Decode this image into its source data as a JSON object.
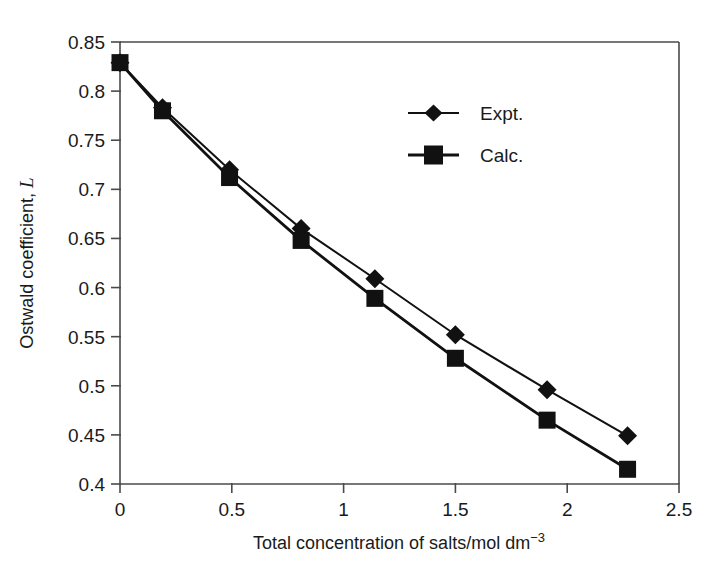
{
  "chart_data": {
    "type": "line",
    "title": "",
    "xlabel": "Total concentration of salts/mol dm⁻³",
    "xlabel_main": "Total concentration of salts/mol dm",
    "xlabel_exponent": "−3",
    "ylabel": "Ostwald coefficient, L",
    "ylabel_main": "Ostwald coefficient,",
    "ylabel_symbol": "L",
    "xlim": [
      0,
      2.5
    ],
    "ylim": [
      0.4,
      0.85
    ],
    "xticks": [
      0,
      0.5,
      1,
      1.5,
      2,
      2.5
    ],
    "xtick_labels": [
      "0",
      "0.5",
      "1",
      "1.5",
      "2",
      "2.5"
    ],
    "yticks": [
      0.4,
      0.45,
      0.5,
      0.55,
      0.6,
      0.65,
      0.7,
      0.75,
      0.8,
      0.85
    ],
    "ytick_labels": [
      "0.4",
      "0.45",
      "0.5",
      "0.55",
      "0.6",
      "0.65",
      "0.7",
      "0.75",
      "0.8",
      "0.85"
    ],
    "grid": false,
    "legend_position": "upper-right-inside",
    "x": [
      0,
      0.19,
      0.49,
      0.81,
      1.14,
      1.5,
      1.91,
      2.27
    ],
    "series": [
      {
        "name": "Expt.",
        "marker": "diamond",
        "color": "#111111",
        "values": [
          0.829,
          0.783,
          0.72,
          0.66,
          0.609,
          0.552,
          0.496,
          0.449
        ]
      },
      {
        "name": "Calc.",
        "marker": "square",
        "color": "#111111",
        "values": [
          0.829,
          0.78,
          0.712,
          0.648,
          0.589,
          0.528,
          0.465,
          0.415
        ]
      }
    ]
  },
  "legend": {
    "entries": [
      {
        "label": "Expt.",
        "marker": "diamond-marker"
      },
      {
        "label": "Calc.",
        "marker": "square-marker"
      }
    ]
  },
  "colors": {
    "axis": "#4a4a4a",
    "data": "#111111",
    "background": "#ffffff"
  }
}
